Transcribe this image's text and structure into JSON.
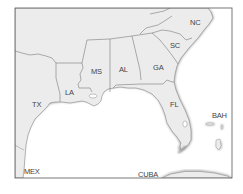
{
  "map": {
    "title": "",
    "colors": {
      "background": "#ffffff",
      "land": "#ececec",
      "border": "#7a7a7a",
      "coast_shadow": "#b5b5b5",
      "label": "#444444",
      "frame": "#555555"
    },
    "labels": {
      "nc": "NC",
      "sc": "SC",
      "ga": "GA",
      "al": "AL",
      "ms": "MS",
      "la": "LA",
      "tx": "TX",
      "fl": "FL",
      "bah": "BAH",
      "mex": "MEX",
      "cuba": "CUBA"
    }
  }
}
